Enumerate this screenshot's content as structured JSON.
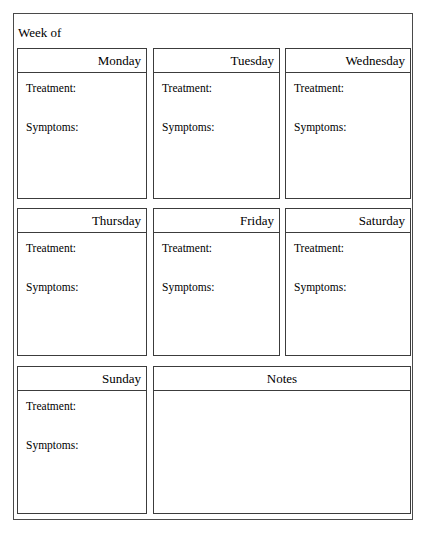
{
  "page": {
    "week_of_label": "Week of",
    "field_labels": {
      "treatment": "Treatment:",
      "symptoms": "Symptoms:"
    }
  },
  "days": [
    {
      "name": "Monday",
      "treatment_label": "Treatment:",
      "symptoms_label": "Symptoms:",
      "treatment_value": "",
      "symptoms_value": ""
    },
    {
      "name": "Tuesday",
      "treatment_label": "Treatment:",
      "symptoms_label": "Symptoms:",
      "treatment_value": "",
      "symptoms_value": ""
    },
    {
      "name": "Wednesday",
      "treatment_label": "Treatment:",
      "symptoms_label": "Symptoms:",
      "treatment_value": "",
      "symptoms_value": ""
    },
    {
      "name": "Thursday",
      "treatment_label": "Treatment:",
      "symptoms_label": "Symptoms:",
      "treatment_value": "",
      "symptoms_value": ""
    },
    {
      "name": "Friday",
      "treatment_label": "Treatment:",
      "symptoms_label": "Symptoms:",
      "treatment_value": "",
      "symptoms_value": ""
    },
    {
      "name": "Saturday",
      "treatment_label": "Treatment:",
      "symptoms_label": "Symptoms:",
      "treatment_value": "",
      "symptoms_value": ""
    },
    {
      "name": "Sunday",
      "treatment_label": "Treatment:",
      "symptoms_label": "Symptoms:",
      "treatment_value": "",
      "symptoms_value": ""
    }
  ],
  "notes": {
    "title": "Notes",
    "value": ""
  },
  "week_of_value": "",
  "colors": {
    "page_border": "#4a4a4a",
    "box_border": "#3c3c3c",
    "background": "#ffffff",
    "text": "#000000"
  }
}
